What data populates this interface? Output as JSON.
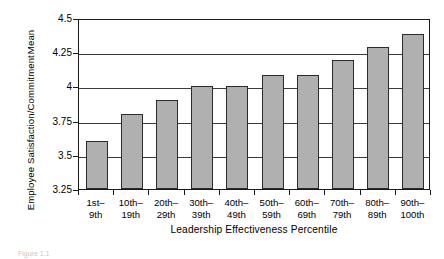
{
  "chart_data": {
    "type": "bar",
    "title": "",
    "xlabel": "Leadership Effectiveness Percentile",
    "ylabel_lines": [
      "Employee Satisfaction/Commitment",
      "Mean"
    ],
    "categories": [
      "1st–\n9th",
      "10th–\n19th",
      "20th–\n29th",
      "30th–\n39th",
      "40th–\n49th",
      "50th–\n59th",
      "60th–\n69th",
      "70th–\n79th",
      "80th–\n89th",
      "90th–\n100th"
    ],
    "category_lines": [
      [
        "1st–",
        "9th"
      ],
      [
        "10th–",
        "19th"
      ],
      [
        "20th–",
        "29th"
      ],
      [
        "30th–",
        "39th"
      ],
      [
        "40th–",
        "49th"
      ],
      [
        "50th–",
        "59th"
      ],
      [
        "60th–",
        "69th"
      ],
      [
        "70th–",
        "79th"
      ],
      [
        "80th–",
        "89th"
      ],
      [
        "90th–",
        "100th"
      ]
    ],
    "values": [
      3.6,
      3.8,
      3.9,
      4.0,
      4.0,
      4.08,
      4.08,
      4.19,
      4.29,
      4.38
    ],
    "ylim": [
      3.25,
      4.5
    ],
    "yticks": [
      "3.25",
      "3.5",
      "3.75",
      "4",
      "4.25",
      "4.5"
    ],
    "ytick_values": [
      3.25,
      3.5,
      3.75,
      4,
      4.25,
      4.5
    ],
    "grid": true,
    "legend": "none",
    "bar_fill": "#b0b0b0",
    "bar_edge": "#2b2b2b",
    "axis_color": "#1a1a1a"
  },
  "caption": "Figure 1.1"
}
